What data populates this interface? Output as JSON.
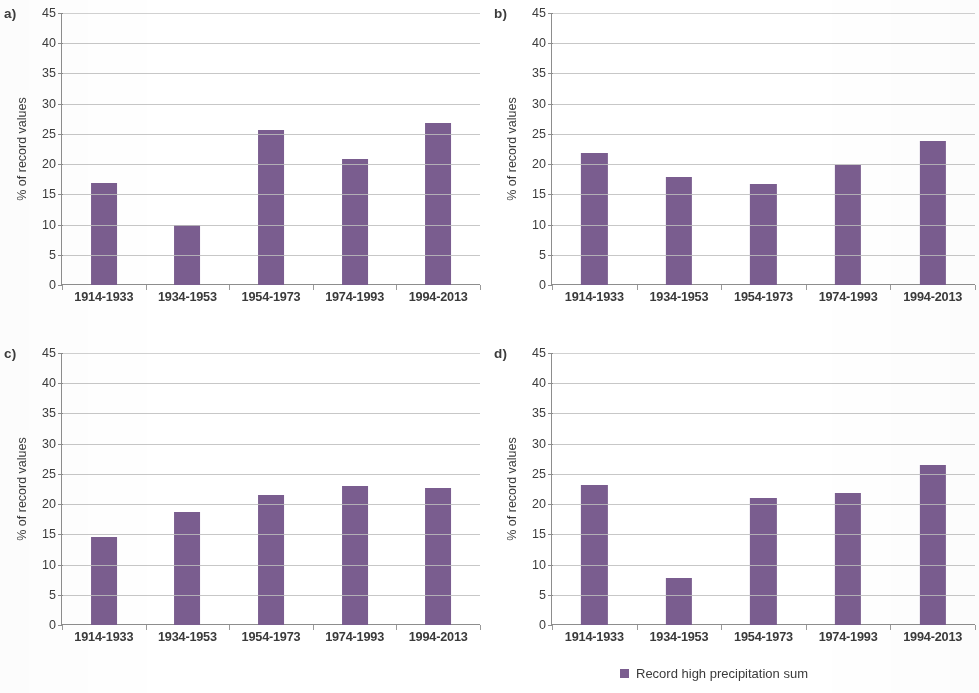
{
  "figure": {
    "y_axis_title": "% of record values",
    "y_ticks": [
      "0",
      "5",
      "10",
      "15",
      "20",
      "25",
      "30",
      "35",
      "40",
      "45"
    ],
    "categories": [
      "1914-1933",
      "1934-1953",
      "1954-1973",
      "1974-1993",
      "1994-2013"
    ],
    "bar_color": "#7a5d8f",
    "gridline_color": "#bdbdbd",
    "legend": {
      "swatch_color": "#7a5d8f",
      "label": "Record high precipitation sum"
    },
    "panels": [
      {
        "key": "a",
        "label": "a)"
      },
      {
        "key": "b",
        "label": "b)"
      },
      {
        "key": "c",
        "label": "c)"
      },
      {
        "key": "d",
        "label": "d)"
      }
    ]
  },
  "chart_data": [
    {
      "type": "bar",
      "title": "a)",
      "categories": [
        "1914-1933",
        "1934-1953",
        "1954-1973",
        "1974-1993",
        "1994-2013"
      ],
      "values": [
        16.9,
        10.0,
        25.6,
        20.9,
        26.8
      ],
      "xlabel": "",
      "ylabel": "% of record values",
      "ylim": [
        0,
        45
      ],
      "ytick_step": 5,
      "grid": true,
      "legend": "Record high precipitation sum",
      "legend_position": "bottom",
      "series_color": "#7a5d8f"
    },
    {
      "type": "bar",
      "title": "b)",
      "categories": [
        "1914-1933",
        "1934-1953",
        "1954-1973",
        "1974-1993",
        "1994-2013"
      ],
      "values": [
        21.9,
        17.8,
        16.7,
        19.8,
        23.9
      ],
      "xlabel": "",
      "ylabel": "% of record values",
      "ylim": [
        0,
        45
      ],
      "ytick_step": 5,
      "grid": true,
      "legend": "Record high precipitation sum",
      "legend_position": "bottom",
      "series_color": "#7a5d8f"
    },
    {
      "type": "bar",
      "title": "c)",
      "categories": [
        "1914-1933",
        "1934-1953",
        "1954-1973",
        "1974-1993",
        "1994-2013"
      ],
      "values": [
        14.6,
        18.7,
        21.5,
        23.0,
        22.6
      ],
      "xlabel": "",
      "ylabel": "% of record values",
      "ylim": [
        0,
        45
      ],
      "ytick_step": 5,
      "grid": true,
      "legend": "Record high precipitation sum",
      "legend_position": "bottom",
      "series_color": "#7a5d8f"
    },
    {
      "type": "bar",
      "title": "d)",
      "categories": [
        "1914-1933",
        "1934-1953",
        "1954-1973",
        "1974-1993",
        "1994-2013"
      ],
      "values": [
        23.2,
        7.7,
        21.0,
        21.8,
        26.4
      ],
      "xlabel": "",
      "ylabel": "% of record values",
      "ylim": [
        0,
        45
      ],
      "ytick_step": 5,
      "grid": true,
      "legend": "Record high precipitation sum",
      "legend_position": "bottom",
      "series_color": "#7a5d8f"
    }
  ]
}
